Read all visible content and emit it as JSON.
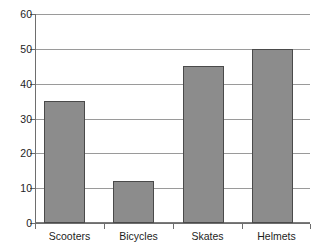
{
  "chart_data": {
    "type": "bar",
    "title": "",
    "subtitle": "",
    "xlabel": "",
    "ylabel": "",
    "categories": [
      "Scooters",
      "Bicycles",
      "Skates",
      "Helmets"
    ],
    "values": [
      35,
      12,
      45,
      50
    ],
    "ylim": [
      0,
      60
    ],
    "yticks": [
      0,
      10,
      20,
      30,
      40,
      50,
      60
    ],
    "ytick_labels": [
      "0",
      "10",
      "20",
      "30",
      "40",
      "50",
      "60"
    ],
    "grid": true,
    "grid_axis": "y",
    "legend": false,
    "legend_position": "none",
    "orientation": "vertical",
    "colors": {
      "bar_fill": "#8c8c8c",
      "bar_border": "#4a4a4a",
      "gridline": "#9a9a9a",
      "axis": "#6e6e6e",
      "text": "#1d1d1d",
      "background": "#ffffff"
    }
  }
}
